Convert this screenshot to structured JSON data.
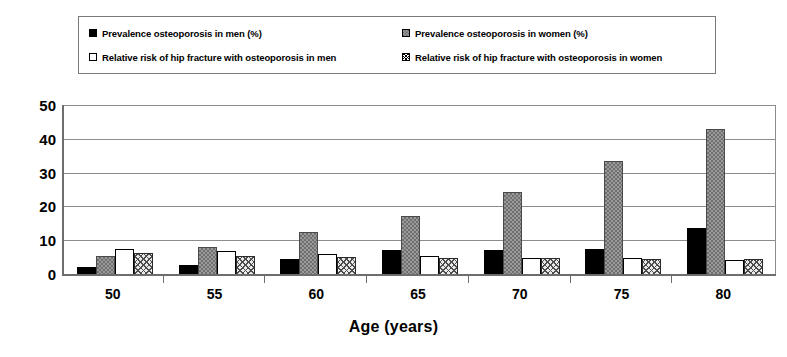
{
  "chart_data": {
    "type": "bar",
    "title": "",
    "xlabel": "Age (years)",
    "ylabel": "",
    "categories": [
      "50",
      "55",
      "60",
      "65",
      "70",
      "75",
      "80"
    ],
    "ylim": [
      0,
      50
    ],
    "yticks": [
      0,
      10,
      20,
      30,
      40,
      50
    ],
    "grid": true,
    "legend_position": "top",
    "series": [
      {
        "name": "Prevalence osteoporosis in men (%)",
        "swatch": "sw-men-prev",
        "color": "#000000",
        "values": [
          2.2,
          2.7,
          4.5,
          7.0,
          7.0,
          7.3,
          13.5
        ]
      },
      {
        "name": "Prevalence osteoporosis in women (%)",
        "swatch": "sw-women-prev",
        "color": "#9a9a9a",
        "values": [
          5.4,
          8.0,
          12.3,
          17.3,
          24.2,
          33.5,
          42.8
        ]
      },
      {
        "name": "Relative risk of hip fracture with osteoporosis in men",
        "swatch": "sw-men-rr",
        "color": "#ffffff",
        "values": [
          7.3,
          6.8,
          6.0,
          5.3,
          4.8,
          4.6,
          4.2
        ]
      },
      {
        "name": "Relative risk of hip fracture with osteoporosis in women",
        "swatch": "sw-women-rr",
        "color": "#ffffff",
        "values": [
          6.2,
          5.3,
          5.0,
          4.8,
          4.7,
          4.5,
          4.4
        ]
      }
    ]
  },
  "legend": {
    "items": [
      "Prevalence osteoporosis in men (%)",
      "Prevalence osteoporosis in women (%)",
      "Relative risk of hip fracture with osteoporosis in men",
      "Relative risk of hip fracture with osteoporosis in women"
    ]
  }
}
